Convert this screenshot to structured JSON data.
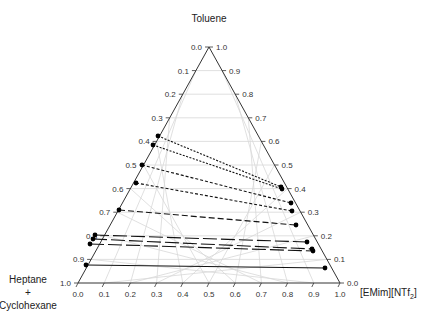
{
  "chart_data": {
    "type": "ternary",
    "title": "",
    "vertices": {
      "top": "Toluene",
      "bottom_left": [
        "Heptane",
        "+",
        "Cyclohexane"
      ],
      "bottom_right": "[EMim][NTf2]"
    },
    "axes": {
      "left_ticks": [
        "0.0",
        "0.1",
        "0.2",
        "0.3",
        "0.4",
        "0.5",
        "0.6",
        "0.7",
        "0.8",
        "0.9",
        "1.0"
      ],
      "right_ticks": [
        "1.0",
        "0.9",
        "0.8",
        "0.7",
        "0.6",
        "0.5",
        "0.4",
        "0.3",
        "0.2",
        "0.1",
        "0.0"
      ],
      "bottom_ticks": [
        "0.0",
        "0.1",
        "0.2",
        "0.3",
        "0.4",
        "0.5",
        "0.6",
        "0.7",
        "0.8",
        "0.9",
        "1.0"
      ]
    },
    "grid": true,
    "tie_lines": [
      {
        "style": "dotted",
        "left": {
          "x": 158,
          "y": 136
        },
        "right": {
          "x": 281,
          "y": 187
        }
      },
      {
        "style": "dotted",
        "left": {
          "x": 153,
          "y": 145
        },
        "right": {
          "x": 282,
          "y": 189
        }
      },
      {
        "style": "dashed-short",
        "left": {
          "x": 142,
          "y": 165
        },
        "right": {
          "x": 291,
          "y": 203
        }
      },
      {
        "style": "dashed-short",
        "left": {
          "x": 136,
          "y": 183
        },
        "right": {
          "x": 292,
          "y": 211
        }
      },
      {
        "style": "dashed",
        "left": {
          "x": 119,
          "y": 210
        },
        "right": {
          "x": 296,
          "y": 225
        }
      },
      {
        "style": "dashed-long",
        "left": {
          "x": 95,
          "y": 235
        },
        "right": {
          "x": 307,
          "y": 242
        }
      },
      {
        "style": "dashed-long",
        "left": {
          "x": 93,
          "y": 239
        },
        "right": {
          "x": 312,
          "y": 249
        }
      },
      {
        "style": "dashed-long",
        "left": {
          "x": 90,
          "y": 244
        },
        "right": {
          "x": 313,
          "y": 251
        }
      },
      {
        "style": "solid",
        "left": {
          "x": 86,
          "y": 265
        },
        "right": {
          "x": 325,
          "y": 268
        }
      }
    ]
  },
  "labels": {
    "top": "Toluene",
    "bl_line1": "Heptane",
    "bl_line2": "+",
    "bl_line3": "Cyclohexane",
    "br_main": "[EMim][NTf",
    "br_sub": "2",
    "br_end": "]"
  },
  "colors": {
    "axis": "#333333",
    "grid": "#d8d8d8",
    "tie": "#111111"
  }
}
